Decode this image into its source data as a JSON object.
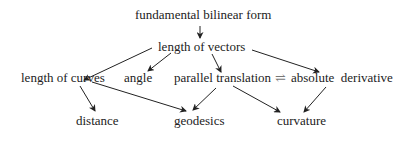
{
  "diagram": {
    "nodes": {
      "fundamental_bilinear_form": "fundamental bilinear form",
      "length_of_vectors": "length of vectors",
      "length_of_curves": "length of curves",
      "angle": "angle",
      "parallel_translation": "parallel translation",
      "equivalence_symbol": "⇌",
      "absolute_derivative": "absolute  derivative",
      "distance": "distance",
      "geodesics": "geodesics",
      "curvature": "curvature"
    },
    "edges": [
      [
        "fundamental bilinear form",
        "length of vectors"
      ],
      [
        "length of vectors",
        "length of curves"
      ],
      [
        "length of vectors",
        "angle"
      ],
      [
        "length of vectors",
        "parallel translation"
      ],
      [
        "length of vectors",
        "absolute derivative"
      ],
      [
        "length of curves",
        "distance"
      ],
      [
        "length of curves",
        "geodesics"
      ],
      [
        "parallel translation",
        "geodesics"
      ],
      [
        "parallel translation",
        "curvature"
      ],
      [
        "absolute derivative",
        "curvature"
      ]
    ]
  }
}
